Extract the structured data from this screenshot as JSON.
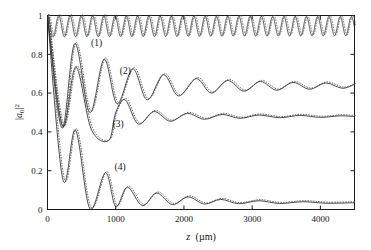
{
  "chart_data": {
    "type": "line",
    "title": "",
    "subtitle": "",
    "xlabel": "z (µm)",
    "ylabel": "|a₀|²",
    "xlabel_parts": {
      "var": "z",
      "unit": "(µm)"
    },
    "ylabel_parts": {
      "base": "a",
      "sub": "0",
      "sup": "2",
      "bar": "|"
    },
    "xlim": [
      0,
      4500
    ],
    "ylim": [
      0,
      1
    ],
    "xticks": [
      0,
      1000,
      2000,
      3000,
      4000
    ],
    "xticklabels": [
      "0",
      "1000",
      "2000",
      "3000",
      "4000"
    ],
    "yticks": [
      0,
      0.2,
      0.4,
      0.6,
      0.8,
      1
    ],
    "yticklabels": [
      "0",
      "0.2",
      "0.4",
      "0.6",
      "0.8",
      "1"
    ],
    "grid": false,
    "legend_position": "inline-annotations",
    "annotations": [
      {
        "text": "(1)",
        "x": 720,
        "y": 0.845,
        "curve": 1
      },
      {
        "text": "(2)",
        "x": 1140,
        "y": 0.7,
        "curve": 2
      },
      {
        "text": "(3)",
        "x": 1035,
        "y": 0.425,
        "curve": 3
      },
      {
        "text": "(4)",
        "x": 1065,
        "y": 0.205,
        "curve": 4
      }
    ],
    "series": [
      {
        "name": "(1)",
        "label": "(1)",
        "style": "solid-with-dotted-overlay",
        "color": "#2a2a2a",
        "description": "Fast small-amplitude oscillation about 0.945, bounded 0.89 to 1.0, period ~165 um, essentially undamped",
        "start_value": 1.0,
        "asymptote": 0.945,
        "oscillation_min": 0.89,
        "oscillation_max": 1.0,
        "period_um": 165,
        "damping_length_um": 40000,
        "phase": 0
      },
      {
        "name": "(2)",
        "label": "(2)",
        "style": "solid-with-dotted-overlay",
        "color": "#2a2a2a",
        "description": "Strongly damped oscillation from 1.0 decaying toward 0.64; first minimum ~0.42 at z~210, first revival peak ~0.855 at z~400",
        "start_value": 1.0,
        "asymptote": 0.64,
        "period_um": 440,
        "damping_length_um": 1400,
        "initial_amplitude": 0.6,
        "phase": 3.1416,
        "key_points": [
          {
            "z": 0,
            "y": 1.0
          },
          {
            "z": 210,
            "y": 0.42
          },
          {
            "z": 400,
            "y": 0.855
          },
          {
            "z": 620,
            "y": 0.5
          },
          {
            "z": 830,
            "y": 0.775
          },
          {
            "z": 1020,
            "y": 0.545
          },
          {
            "z": 1250,
            "y": 0.725
          },
          {
            "z": 1460,
            "y": 0.565
          },
          {
            "z": 1700,
            "y": 0.695
          },
          {
            "z": 1920,
            "y": 0.585
          },
          {
            "z": 2180,
            "y": 0.675
          },
          {
            "z": 2400,
            "y": 0.6
          },
          {
            "z": 2640,
            "y": 0.665
          },
          {
            "z": 2880,
            "y": 0.61
          },
          {
            "z": 3120,
            "y": 0.66
          },
          {
            "z": 3360,
            "y": 0.615
          },
          {
            "z": 3600,
            "y": 0.655
          },
          {
            "z": 3840,
            "y": 0.62
          },
          {
            "z": 4080,
            "y": 0.652
          },
          {
            "z": 4320,
            "y": 0.625
          },
          {
            "z": 4500,
            "y": 0.645
          }
        ]
      },
      {
        "name": "(3)",
        "label": "(3)",
        "style": "solid-with-dotted-overlay",
        "color": "#2a2a2a",
        "description": "Damped oscillation from 1.0 decaying toward 0.48; deep minima near 0.355 at z~900",
        "start_value": 1.0,
        "asymptote": 0.48,
        "period_um": 455,
        "damping_length_um": 1150,
        "initial_amplitude": 0.56,
        "phase": 3.1416,
        "key_points": [
          {
            "z": 0,
            "y": 1.0
          },
          {
            "z": 220,
            "y": 0.43
          },
          {
            "z": 415,
            "y": 0.735
          },
          {
            "z": 640,
            "y": 0.415
          },
          {
            "z": 895,
            "y": 0.355
          },
          {
            "z": 1000,
            "y": 0.5
          },
          {
            "z": 1140,
            "y": 0.565
          },
          {
            "z": 1330,
            "y": 0.44
          },
          {
            "z": 1560,
            "y": 0.505
          },
          {
            "z": 1800,
            "y": 0.455
          },
          {
            "z": 2050,
            "y": 0.495
          },
          {
            "z": 2300,
            "y": 0.465
          },
          {
            "z": 2560,
            "y": 0.49
          },
          {
            "z": 2820,
            "y": 0.47
          },
          {
            "z": 3100,
            "y": 0.487
          },
          {
            "z": 3400,
            "y": 0.473
          },
          {
            "z": 3700,
            "y": 0.485
          },
          {
            "z": 4000,
            "y": 0.475
          },
          {
            "z": 4300,
            "y": 0.483
          },
          {
            "z": 4500,
            "y": 0.478
          }
        ]
      },
      {
        "name": "(4)",
        "label": "(4)",
        "style": "solid-with-dotted-overlay",
        "color": "#2a2a2a",
        "description": "Heavily damped oscillation from 1.0 decaying toward 0.03, touching near zero at the minima",
        "start_value": 1.0,
        "asymptote": 0.03,
        "period_um": 450,
        "damping_length_um": 900,
        "initial_amplitude": 0.5,
        "phase": 3.1416,
        "key_points": [
          {
            "z": 0,
            "y": 1.0
          },
          {
            "z": 225,
            "y": 0.155
          },
          {
            "z": 410,
            "y": 0.41
          },
          {
            "z": 620,
            "y": 0.005
          },
          {
            "z": 850,
            "y": 0.19
          },
          {
            "z": 1000,
            "y": 0.015
          },
          {
            "z": 1170,
            "y": 0.115
          },
          {
            "z": 1390,
            "y": 0.02
          },
          {
            "z": 1600,
            "y": 0.085
          },
          {
            "z": 1830,
            "y": 0.025
          },
          {
            "z": 2060,
            "y": 0.065
          },
          {
            "z": 2300,
            "y": 0.028
          },
          {
            "z": 2540,
            "y": 0.052
          },
          {
            "z": 2800,
            "y": 0.03
          },
          {
            "z": 3100,
            "y": 0.045
          },
          {
            "z": 3400,
            "y": 0.031
          },
          {
            "z": 3750,
            "y": 0.04
          },
          {
            "z": 4100,
            "y": 0.032
          },
          {
            "z": 4500,
            "y": 0.035
          }
        ]
      }
    ]
  }
}
